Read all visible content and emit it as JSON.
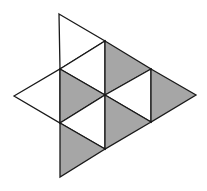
{
  "diagram": {
    "type": "triangle-net",
    "colors": {
      "shaded": "#a6a6a6",
      "unshaded": "#ffffff",
      "stroke": "#1a1a1a"
    },
    "triangles": [
      {
        "id": "t1",
        "points": "59,14 105,41 60,69",
        "shaded": false
      },
      {
        "id": "t2",
        "points": "60,69 105,41 105,95",
        "shaded": false
      },
      {
        "id": "t3",
        "points": "105,41 151,69 105,95",
        "shaded": true
      },
      {
        "id": "t4",
        "points": "14,96 60,69 60,123",
        "shaded": false
      },
      {
        "id": "t5",
        "points": "60,69 105,95 60,123",
        "shaded": true
      },
      {
        "id": "t6",
        "points": "105,95 151,69 151,122",
        "shaded": false
      },
      {
        "id": "t7",
        "points": "151,69 196,95 151,122",
        "shaded": true
      },
      {
        "id": "t8",
        "points": "60,123 105,95 105,149",
        "shaded": false
      },
      {
        "id": "t9",
        "points": "105,95 151,122 105,149",
        "shaded": true
      },
      {
        "id": "t10",
        "points": "60,123 105,149 60,177",
        "shaded": true
      }
    ],
    "counts": {
      "total": 10,
      "shaded": 5,
      "unshaded": 5
    }
  }
}
